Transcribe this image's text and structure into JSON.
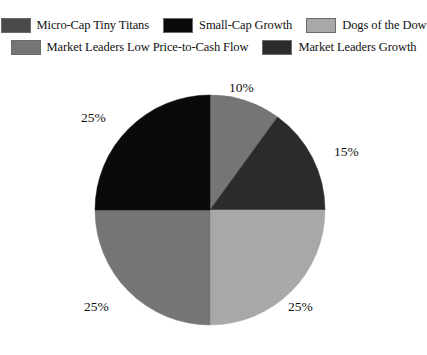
{
  "legend": {
    "rows": [
      [
        {
          "label": "Micro-Cap Tiny Titans",
          "color": "#4a4a4a"
        },
        {
          "label": "Small-Cap Growth",
          "color": "#0a0a0a"
        },
        {
          "label": "Dogs of the Dow",
          "color": "#a8a8a8"
        }
      ],
      [
        {
          "label": "Market Leaders Low Price-to-Cash Flow",
          "color": "#757575"
        },
        {
          "label": "Market Leaders Growth",
          "color": "#2b2b2b"
        }
      ]
    ]
  },
  "chart_data": {
    "type": "pie",
    "title": "",
    "start_angle": 0,
    "direction": "clockwise",
    "categories": [
      "Market Leaders Low Price-to-Cash Flow",
      "Micro-Cap Tiny Titans",
      "Dogs of the Dow",
      "Market Leaders Low Price-to-Cash Flow",
      "Small-Cap Growth"
    ],
    "values": [
      10,
      15,
      25,
      25,
      25
    ],
    "labels": [
      "10%",
      "15%",
      "25%",
      "25%",
      "25%"
    ],
    "colors": [
      "#757575",
      "#2b2b2b",
      "#a8a8a8",
      "#757575",
      "#0a0a0a"
    ],
    "legend_position": "top",
    "grid": false
  },
  "pie_geometry": {
    "center_x": 210,
    "center_y": 132,
    "radius": 115
  }
}
